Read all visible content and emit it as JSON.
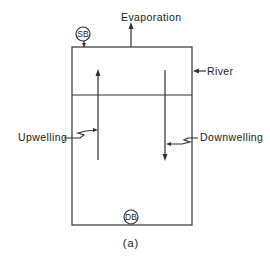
{
  "diagram": {
    "type": "box-model",
    "caption": "(a)",
    "labels": {
      "evaporation": "Evaporation",
      "river": "River",
      "upwelling": "Upwelling",
      "downwelling": "Downwelling"
    },
    "nodes": {
      "surface_box": "SB",
      "deep_box": "DB"
    },
    "layers": [
      "surface layer",
      "deep layer"
    ],
    "flows": [
      {
        "name": "Evaporation",
        "direction": "out-up",
        "from": "surface layer"
      },
      {
        "name": "River",
        "direction": "in-left",
        "to": "surface layer"
      },
      {
        "name": "Upwelling",
        "direction": "up",
        "from": "deep layer",
        "to": "surface layer"
      },
      {
        "name": "Downwelling",
        "direction": "down",
        "from": "surface layer",
        "to": "deep layer"
      }
    ],
    "colors": {
      "stroke": "#333333",
      "text": "#222222",
      "background": "#ffffff"
    }
  }
}
